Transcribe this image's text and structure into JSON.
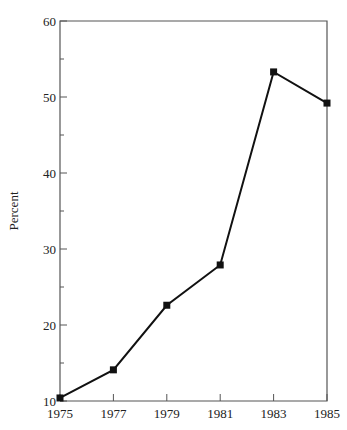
{
  "chart_data": {
    "type": "line",
    "title": "",
    "xlabel": "",
    "ylabel": "Percent",
    "x": [
      1975,
      1977,
      1979,
      1981,
      1983,
      1985
    ],
    "series": [
      {
        "name": "Percent",
        "values": [
          10.4,
          14.1,
          22.6,
          27.9,
          53.3,
          49.2
        ],
        "marker": "square",
        "color": "#111111"
      }
    ],
    "xlim": [
      1975,
      1985
    ],
    "ylim": [
      10,
      60
    ],
    "x_ticks": [
      "1975",
      "1977",
      "1979",
      "1981",
      "1983",
      "1985"
    ],
    "y_ticks": [
      "10",
      "20",
      "30",
      "40",
      "50",
      "60"
    ],
    "y_minor_ticks": [
      15,
      25,
      35,
      45,
      55
    ],
    "grid": false,
    "legend": null,
    "frame": "left, top, right and bottom axis lines"
  }
}
